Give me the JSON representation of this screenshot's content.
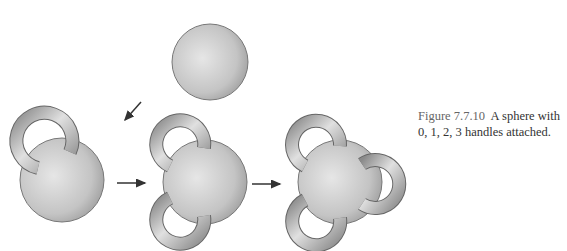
{
  "figure": {
    "label": "Figure 7.7.10",
    "caption": "A sphere with 0, 1, 2, 3 handles attached.",
    "panels": [
      {
        "handles": 0
      },
      {
        "handles": 1
      },
      {
        "handles": 2
      },
      {
        "handles": 3
      }
    ],
    "colors": {
      "sphere_light": "#e4e4e4",
      "sphere_dark": "#a8a8a8",
      "outline": "#707070",
      "arrow": "#333333"
    }
  }
}
